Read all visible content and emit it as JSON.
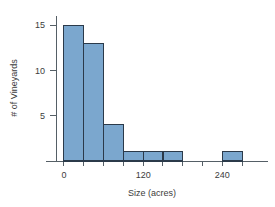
{
  "chart_data": {
    "type": "bar",
    "title": "",
    "subtitle": "",
    "xlabel": "Size (acres)",
    "ylabel": "# of Vineyards",
    "bin_width": 30,
    "bin_starts": [
      0,
      30,
      60,
      90,
      120,
      150,
      180,
      210,
      240
    ],
    "categories": [
      "0-30",
      "30-60",
      "60-90",
      "90-120",
      "120-150",
      "150-180",
      "180-210",
      "210-240",
      "240-270"
    ],
    "values": [
      15,
      13,
      4,
      1,
      1,
      1,
      0,
      0,
      1
    ],
    "x": [
      0,
      30,
      60,
      90,
      120,
      150,
      180,
      210,
      240
    ],
    "xlim": [
      -12,
      300
    ],
    "ylim": [
      0,
      16
    ],
    "xticks": [
      0,
      30,
      60,
      90,
      120,
      150,
      180,
      210,
      240,
      270
    ],
    "xtick_labels": [
      "0",
      "",
      "",
      "",
      "120",
      "",
      "",
      "",
      "240",
      ""
    ],
    "yticks": [
      5,
      10,
      15
    ],
    "ytick_labels": [
      "5",
      "10",
      "15"
    ],
    "grid": false,
    "legend": false,
    "legend_position": "none",
    "bar_fill_color": "#7BA7CE",
    "bar_edge_color": "#2B3A4A",
    "axis_color": "#555F66",
    "background_color": "#FFFFFF"
  }
}
